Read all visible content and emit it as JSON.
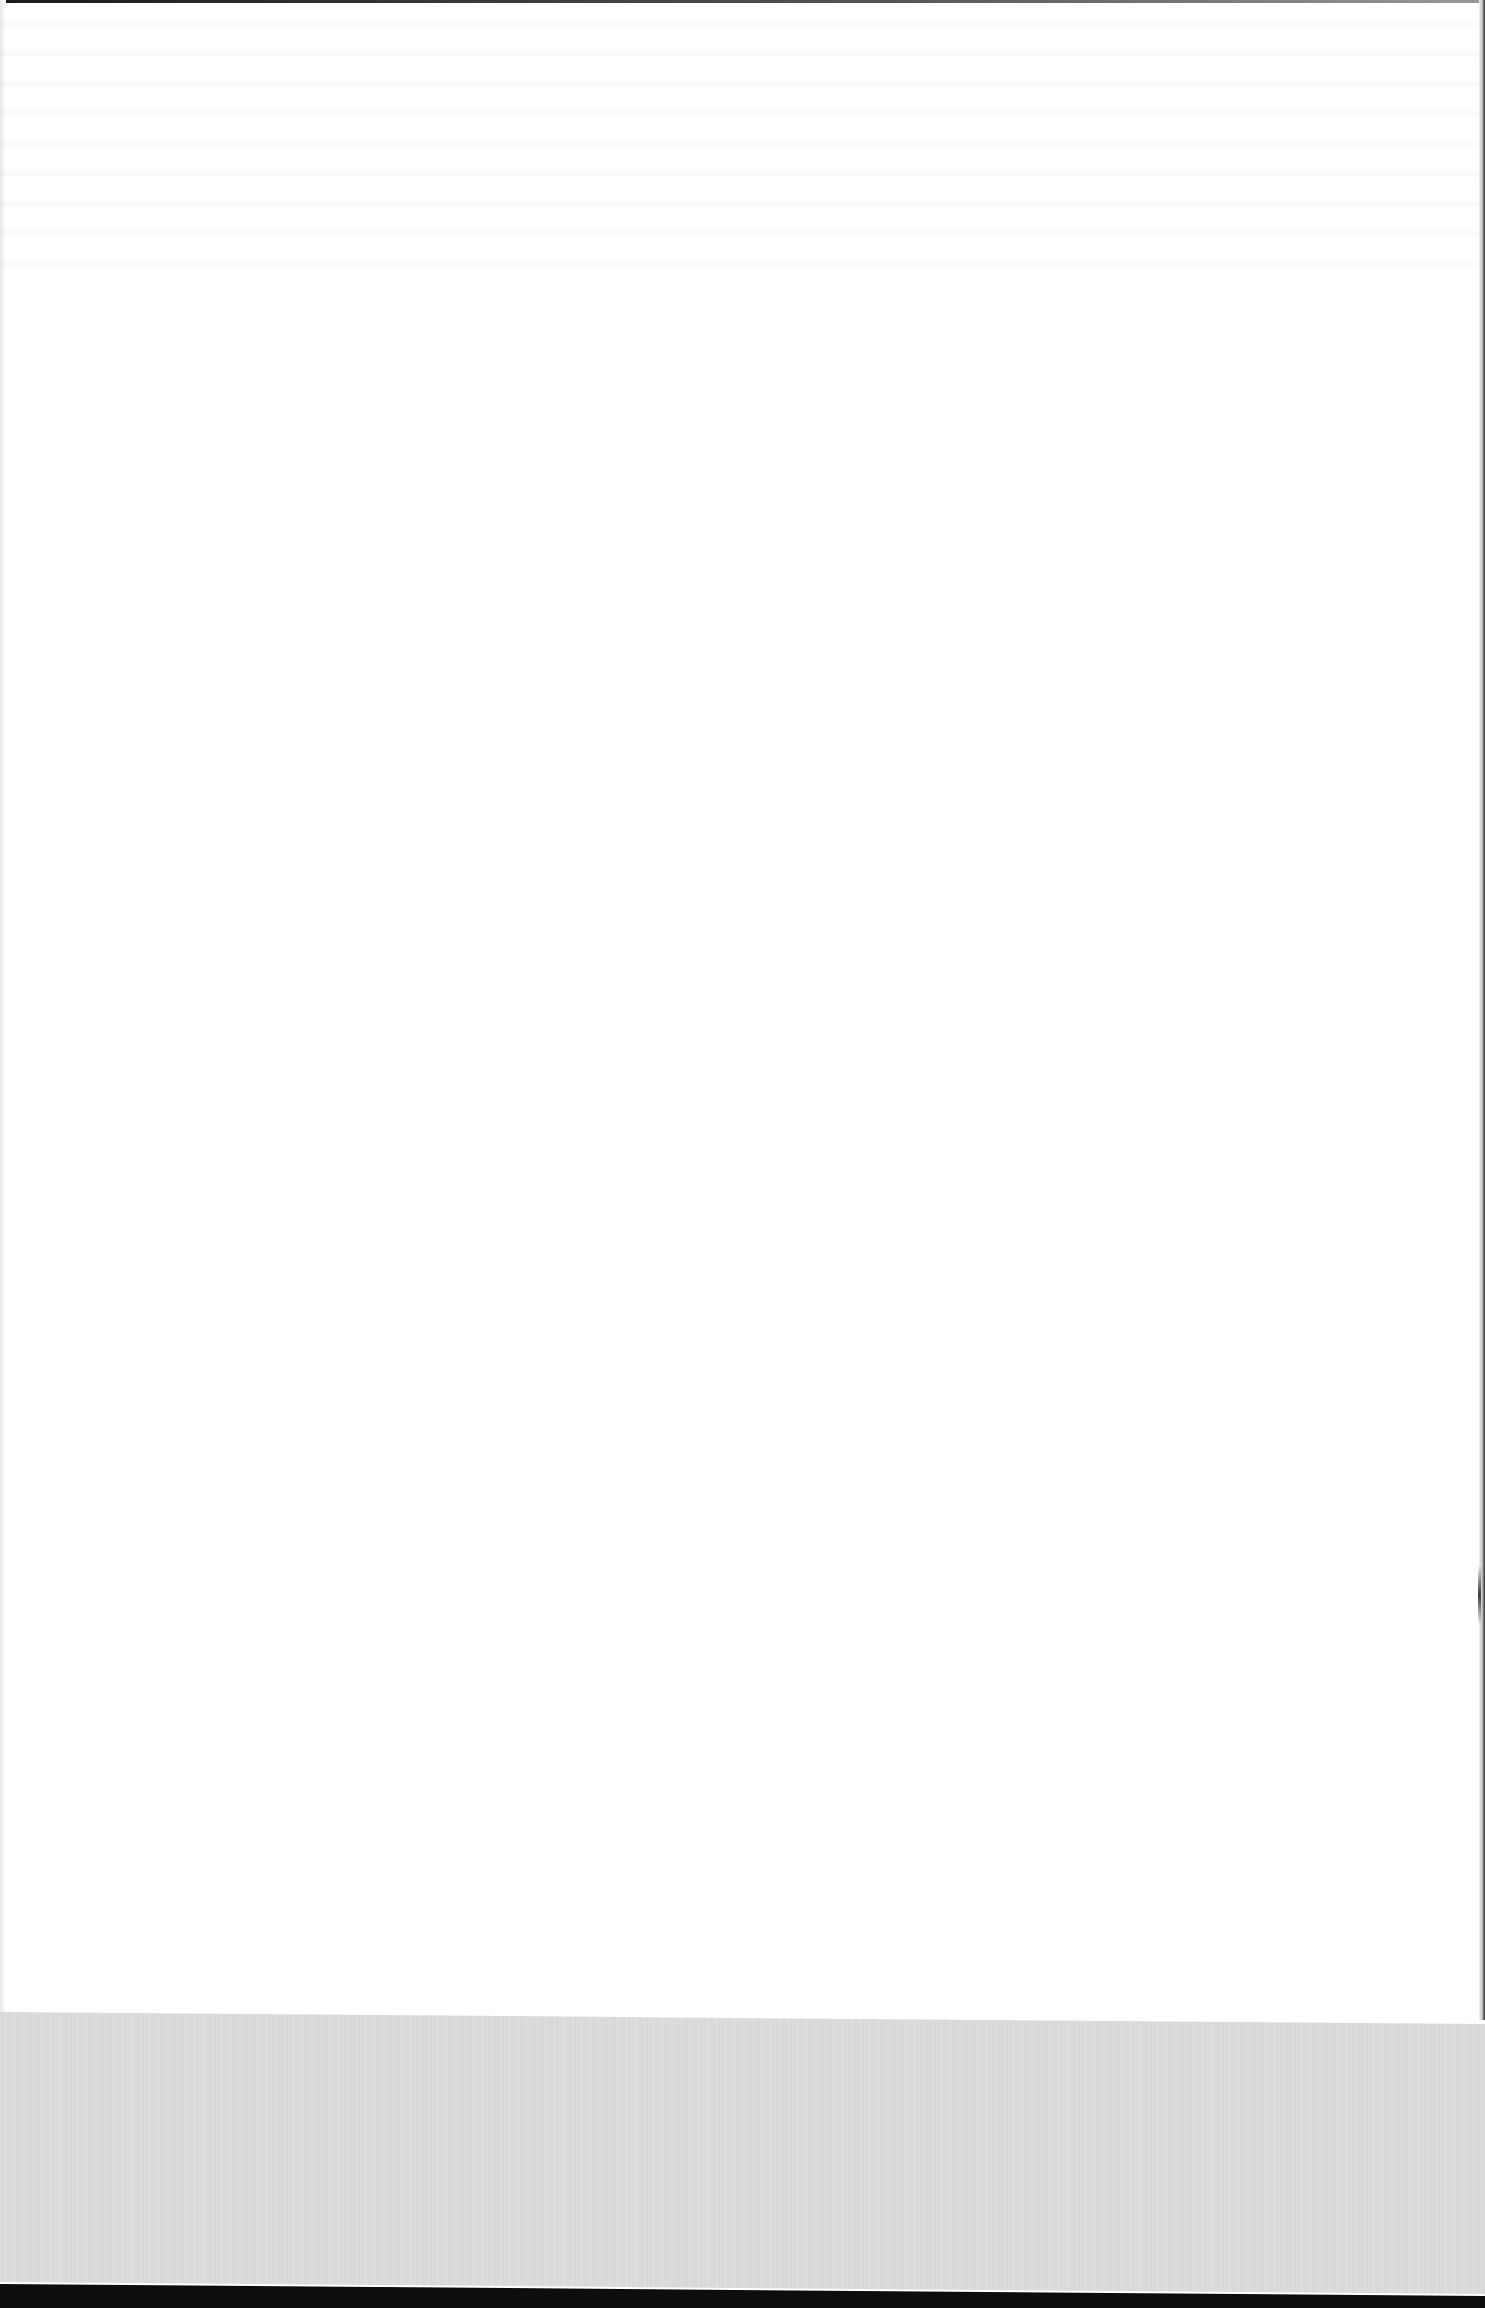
{
  "document": {
    "type": "scanned-page",
    "content_state": "blank",
    "visible_text": [],
    "artifacts": {
      "show_through": "faint, illegible",
      "bottom_band": "gray scanner bed region",
      "edges": "dark scanner borders on top, right and bottom"
    }
  },
  "colors": {
    "page": "#ffffff",
    "bottom_band": "#d9d9d9",
    "edge": "#0d0d0d"
  }
}
